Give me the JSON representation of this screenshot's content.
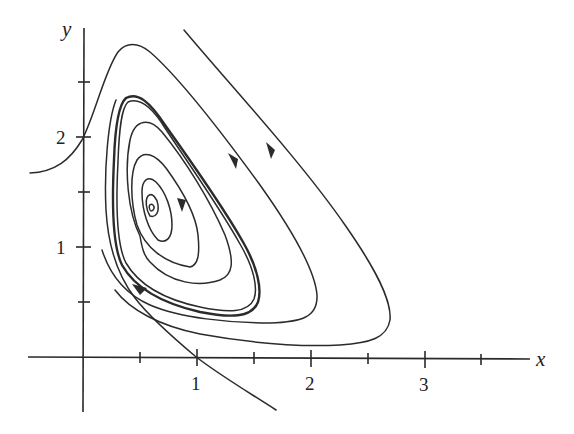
{
  "figure": {
    "type": "phase-portrait",
    "axes": {
      "x_label": "x",
      "y_label": "y",
      "x_ticks": [
        {
          "value": 0.5,
          "label": ""
        },
        {
          "value": 1,
          "label": "1"
        },
        {
          "value": 1.5,
          "label": ""
        },
        {
          "value": 2,
          "label": "2"
        },
        {
          "value": 2.5,
          "label": ""
        },
        {
          "value": 3,
          "label": "3"
        },
        {
          "value": 3.5,
          "label": ""
        }
      ],
      "y_ticks": [
        {
          "value": 0.5,
          "label": ""
        },
        {
          "value": 1,
          "label": "1"
        },
        {
          "value": 1.5,
          "label": ""
        },
        {
          "value": 2,
          "label": "2"
        },
        {
          "value": 2.5,
          "label": ""
        }
      ],
      "x_range": [
        -0.5,
        4.0
      ],
      "y_range": [
        -0.5,
        3.0
      ]
    },
    "equilibrium": {
      "x": 0.6,
      "y": 1.4,
      "kind": "spiral"
    },
    "trajectories": [
      {
        "name": "outer-right",
        "start": [
          0.85,
          3.0
        ],
        "end": [
          1.2,
          0.3
        ],
        "arrows": 1
      },
      {
        "name": "outer-left",
        "start": [
          -0.5,
          1.65
        ],
        "end": [
          1.7,
          -0.5
        ],
        "arrows": 1
      },
      {
        "name": "limit-cycle",
        "arrows": 0
      },
      {
        "name": "inner-spiral",
        "arrows": 1
      }
    ],
    "colors": {
      "ink": "#2b2b2b",
      "background": "#ffffff"
    }
  }
}
